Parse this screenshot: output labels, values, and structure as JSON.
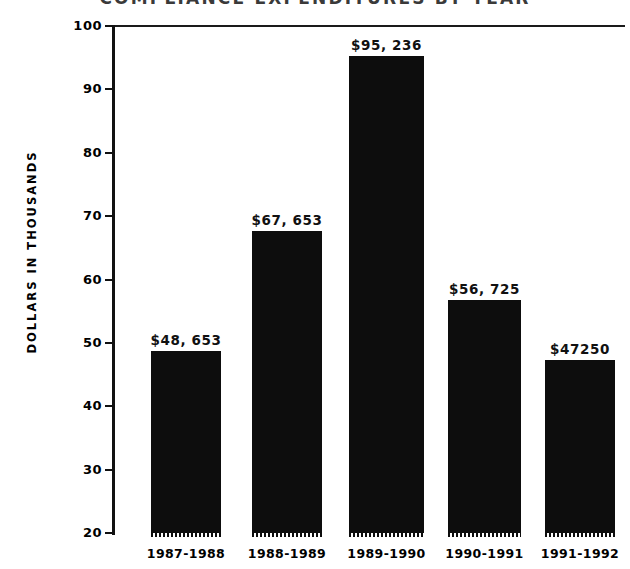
{
  "chart_data": {
    "type": "bar",
    "title": "COMPLIANCE EXPENDITURES BY YEAR",
    "xlabel": "",
    "ylabel": "DOLLARS IN THOUSANDS",
    "ylim": [
      20,
      100
    ],
    "yticks": [
      20,
      30,
      40,
      50,
      60,
      70,
      80,
      90,
      100
    ],
    "ytick_labels": [
      "20",
      "30",
      "40",
      "50",
      "60",
      "70",
      "80",
      "90",
      "100"
    ],
    "grid": false,
    "legend": null,
    "bar_color": "#0d0d0d",
    "categories": [
      "1987-1988",
      "1988-1989",
      "1989-1990",
      "1990-1991",
      "1991-1992"
    ],
    "values": [
      48.653,
      67.653,
      95.236,
      56.725,
      47.25
    ],
    "data_labels": [
      "$48, 653",
      "$67, 653",
      "$95, 236",
      "$56, 725",
      "$47250"
    ]
  }
}
